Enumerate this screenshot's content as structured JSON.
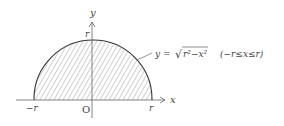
{
  "diagram": {
    "axes": {
      "x_label": "x",
      "y_label": "y",
      "origin_label": "O"
    },
    "ticks": {
      "x_neg": "−r",
      "x_pos": "r",
      "y_top": "r"
    },
    "equation": {
      "lhs": "y = ",
      "sqrt_symbol": "√",
      "radicand": "r²−x²",
      "domain": "(−r≤x≤r)"
    },
    "colors": {
      "curve": "#333333",
      "hatch": "#888888",
      "axis": "#666666"
    }
  }
}
